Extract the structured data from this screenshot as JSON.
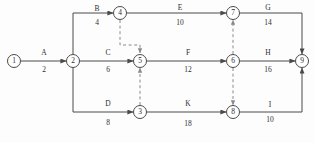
{
  "diagram": {
    "type": "activity-on-arrow-network",
    "title": "",
    "colors": {
      "background": "#fdfdfd",
      "line": "#4a4a4a",
      "dummy_line": "#8a8a8a",
      "text": "#2f2f2f"
    },
    "nodes": [
      {
        "id": "1",
        "label": "1",
        "x": 14,
        "y": 61
      },
      {
        "id": "2",
        "label": "2",
        "x": 73,
        "y": 61
      },
      {
        "id": "4",
        "label": "4",
        "x": 120,
        "y": 13
      },
      {
        "id": "5",
        "label": "5",
        "x": 140,
        "y": 61
      },
      {
        "id": "3",
        "label": "3",
        "x": 140,
        "y": 112
      },
      {
        "id": "7",
        "label": "7",
        "x": 233,
        "y": 13
      },
      {
        "id": "6",
        "label": "6",
        "x": 233,
        "y": 61
      },
      {
        "id": "8",
        "label": "8",
        "x": 233,
        "y": 112
      },
      {
        "id": "9",
        "label": "9",
        "x": 302,
        "y": 61
      }
    ],
    "activities": [
      {
        "id": "A",
        "name": "A",
        "duration": "2",
        "from": "1",
        "to": "2",
        "name_x": 44,
        "name_y": 53,
        "dur_x": 44,
        "dur_y": 70
      },
      {
        "id": "B",
        "name": "B",
        "duration": "4",
        "from": "2",
        "to": "4",
        "name_x": 97,
        "name_y": 9,
        "dur_x": 97,
        "dur_y": 23
      },
      {
        "id": "C",
        "name": "C",
        "duration": "6",
        "from": "2",
        "to": "5",
        "name_x": 108,
        "name_y": 53,
        "dur_x": 108,
        "dur_y": 70
      },
      {
        "id": "D",
        "name": "D",
        "duration": "8",
        "from": "2",
        "to": "3",
        "name_x": 108,
        "name_y": 104,
        "dur_x": 108,
        "dur_y": 123
      },
      {
        "id": "E",
        "name": "E",
        "duration": "10",
        "from": "4",
        "to": "7",
        "name_x": 180,
        "name_y": 8,
        "dur_x": 180,
        "dur_y": 23
      },
      {
        "id": "F",
        "name": "F",
        "duration": "12",
        "from": "5",
        "to": "6",
        "name_x": 188,
        "name_y": 53,
        "dur_x": 188,
        "dur_y": 70
      },
      {
        "id": "K",
        "name": "K",
        "duration": "18",
        "from": "3",
        "to": "8",
        "name_x": 188,
        "name_y": 104,
        "dur_x": 188,
        "dur_y": 124
      },
      {
        "id": "G",
        "name": "G",
        "duration": "14",
        "from": "7",
        "to": "9",
        "name_x": 268,
        "name_y": 8,
        "dur_x": 268,
        "dur_y": 23
      },
      {
        "id": "H",
        "name": "H",
        "duration": "16",
        "from": "6",
        "to": "9",
        "name_x": 268,
        "name_y": 53,
        "dur_x": 268,
        "dur_y": 70
      },
      {
        "id": "I",
        "name": "I",
        "duration": "10",
        "from": "8",
        "to": "9",
        "name_x": 270,
        "name_y": 105,
        "dur_x": 270,
        "dur_y": 120
      }
    ],
    "dummy_activities": [
      {
        "id": "dummy-4-5",
        "from": "4",
        "to": "5",
        "direction": "down"
      },
      {
        "id": "dummy-6-7",
        "from": "6",
        "to": "7",
        "direction": "up"
      },
      {
        "id": "dummy-3-5",
        "from": "3",
        "to": "5",
        "direction": "up"
      },
      {
        "id": "dummy-6-8",
        "from": "6",
        "to": "8",
        "direction": "down"
      }
    ]
  }
}
